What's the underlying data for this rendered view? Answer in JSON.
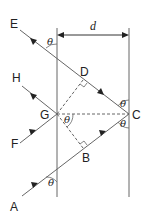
{
  "diagram": {
    "type": "thin-film-interference",
    "distance_label": "d",
    "angle_symbol": "θ",
    "points": {
      "E": "E",
      "D": "D",
      "H": "H",
      "G": "G",
      "C": "C",
      "F": "F",
      "B": "B",
      "A": "A"
    },
    "colors": {
      "line": "#555555",
      "text": "#222222",
      "background": "#ffffff"
    }
  }
}
